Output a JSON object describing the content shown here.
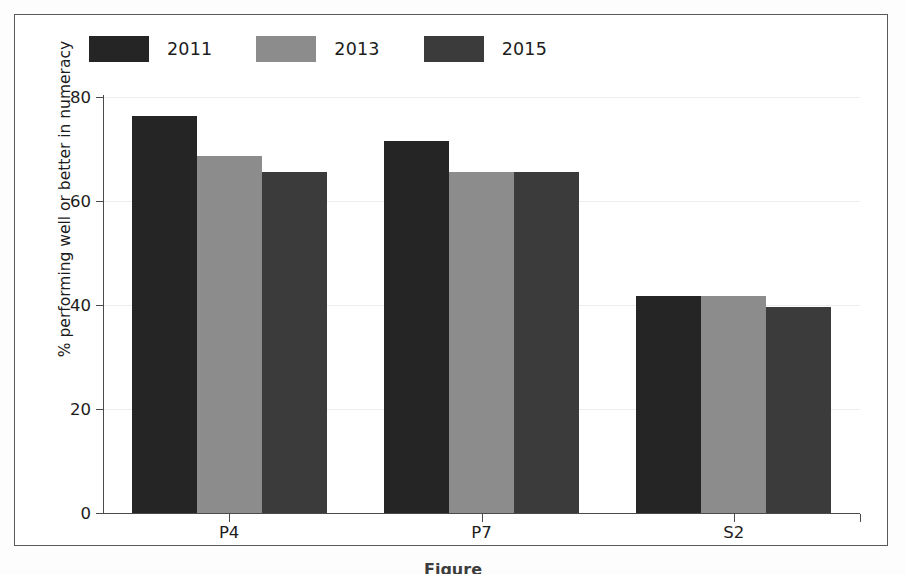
{
  "chart_data": {
    "type": "bar",
    "title": "",
    "subtitle": "",
    "xlabel": "",
    "ylabel": "% performing well or better in numeracy",
    "categories": [
      "P4",
      "P7",
      "S2"
    ],
    "series": [
      {
        "name": "2011",
        "color": "#252525",
        "values": [
          76.3,
          71.5,
          41.8
        ]
      },
      {
        "name": "2013",
        "color": "#8c8c8c",
        "values": [
          68.7,
          65.5,
          41.8
        ]
      },
      {
        "name": "2015",
        "color": "#3b3b3b",
        "values": [
          65.6,
          65.6,
          39.6
        ]
      }
    ],
    "ylim": [
      0,
      80
    ],
    "yticks": [
      0,
      20,
      40,
      60,
      80
    ],
    "ytick_labels": [
      "0",
      "20",
      "40",
      "60",
      "80"
    ],
    "grid": true,
    "grid_axis": "y",
    "legend_position": "top-left",
    "legend_entries": [
      "2011",
      "2013",
      "2015"
    ]
  },
  "figure": {
    "caption": "Figure",
    "border_color": "#5a5a5a",
    "background": "#ffffff",
    "axis_color": "#4a4a4a",
    "gridline_color": "#ededed"
  }
}
